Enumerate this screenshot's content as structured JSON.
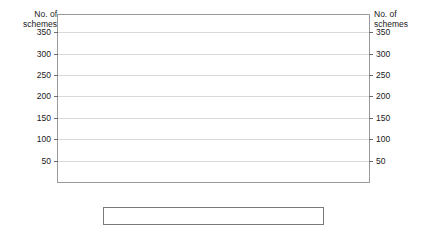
{
  "chart_data": {
    "type": "bar",
    "title": "",
    "xlabel": "",
    "ylabel": "No. of schemes",
    "ylabel_right": "No. of schemes",
    "ylim": [
      0,
      390
    ],
    "yticks": [
      50,
      100,
      150,
      200,
      250,
      300,
      350
    ],
    "grid": true,
    "legend_position": "bottom",
    "categories": [
      "Pre-2008",
      "Post-2008"
    ],
    "series": [
      {
        "name": "Total",
        "values": [
          369,
          282
        ],
        "pattern": "solid-black",
        "color": "#0a0a0a"
      },
      {
        "name": "Forestry",
        "values": [
          188,
          132
        ],
        "pattern": "dark-dotted",
        "color": "#6f6f6f"
      },
      {
        "name": "Non-Forestry",
        "values": [
          152,
          119
        ],
        "pattern": "light-checkered",
        "color": "#d6d6d6"
      },
      {
        "name": "Land",
        "values": [
          21,
          16
        ],
        "pattern": "horizontal-lines",
        "color": "#c9c9c9"
      }
    ]
  },
  "axis": {
    "left_title_line1": "No. of",
    "left_title_line2": "schemes",
    "right_title_line1": "No. of",
    "right_title_line2": "schemes",
    "tick_labels": [
      "350",
      "300",
      "250",
      "200",
      "150",
      "100",
      "50"
    ]
  },
  "categories": [
    {
      "label": "Pre-2008"
    },
    {
      "label": "Post-2008"
    }
  ],
  "legend": {
    "items": [
      {
        "label": "Total"
      },
      {
        "label": "Forestry"
      },
      {
        "label": "Non-Forestry"
      },
      {
        "label": "Land"
      }
    ]
  }
}
